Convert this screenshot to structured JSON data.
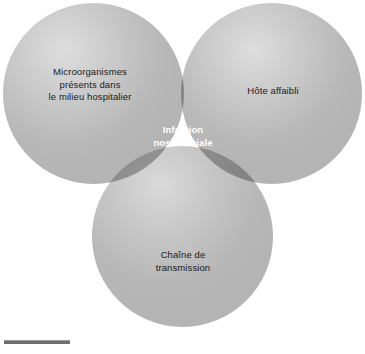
{
  "figure": {
    "type": "venn-diagram",
    "set_count": 3,
    "colors": {
      "circle_fill": "#b4b4b4",
      "pair_overlap": "#888888",
      "triple_overlap": "#4a4a4a",
      "background": "#ffffff",
      "label_text": "#1a1a1a",
      "center_text": "#ffffff",
      "rule": "#6e6e6e"
    },
    "sets": [
      {
        "id": "microorganismes",
        "position": "top-left",
        "label": "Microorganismes\npresents dans\nle milieu hospitalier"
      },
      {
        "id": "hote-affaibli",
        "position": "top-right",
        "label": "Hote affaibli"
      },
      {
        "id": "chaine-transmission",
        "position": "bottom",
        "label": "Chaine de\ntransmission"
      }
    ],
    "intersection": {
      "id": "infection-nosocomiale",
      "label": "Infection\nnosocomiale"
    }
  }
}
